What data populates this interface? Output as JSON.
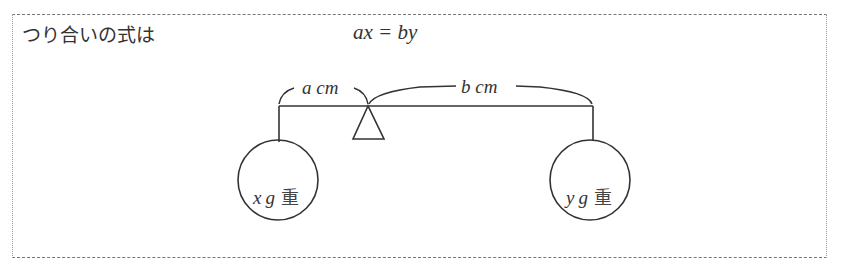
{
  "intro_text": "つり合いの式は",
  "equation": "ax = by",
  "diagram": {
    "left_arm_label": "a cm",
    "right_arm_label": "b cm",
    "left_weight": {
      "var": "x",
      "unit": "g",
      "suffix": "重"
    },
    "right_weight": {
      "var": "y",
      "unit": "g",
      "suffix": "重"
    }
  }
}
